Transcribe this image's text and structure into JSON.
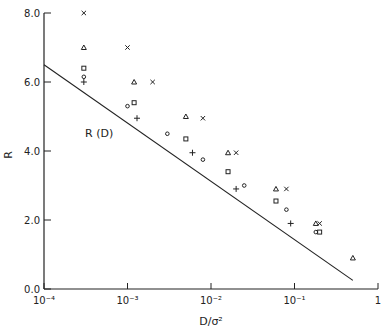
{
  "chart_data": {
    "type": "scatter",
    "title": "",
    "xlabel": "D/σ²",
    "ylabel": "R",
    "xscale": "log",
    "xlim": [
      0.0001,
      1
    ],
    "ylim": [
      0,
      8
    ],
    "x_tick_labels": [
      "10⁻⁴",
      "10⁻³",
      "10⁻²",
      "10⁻¹",
      "1"
    ],
    "y_tick_labels": [
      "0.0",
      "2.0",
      "4.0",
      "6.0",
      "8.0"
    ],
    "grid": false,
    "annotations": [
      {
        "text": "R (D)",
        "x": 0.00031,
        "y": 4.4
      }
    ],
    "curve": {
      "name": "R (D)",
      "x": [
        0.0001,
        0.5
      ],
      "y": [
        6.5,
        0.25
      ]
    },
    "series": [
      {
        "name": "×",
        "marker": "cross",
        "x": [
          0.0003,
          0.001,
          0.002,
          0.008,
          0.02,
          0.08,
          0.2
        ],
        "y": [
          8.0,
          7.0,
          6.0,
          4.95,
          3.95,
          2.9,
          1.9
        ]
      },
      {
        "name": "▲",
        "marker": "triangle",
        "x": [
          0.0003,
          0.0012,
          0.005,
          0.016,
          0.06,
          0.18,
          0.5
        ],
        "y": [
          7.0,
          6.0,
          5.0,
          3.95,
          2.9,
          1.9,
          0.9
        ]
      },
      {
        "name": "□",
        "marker": "square",
        "x": [
          0.0003,
          0.0012,
          0.005,
          0.016,
          0.06,
          0.2
        ],
        "y": [
          6.4,
          5.4,
          4.35,
          3.4,
          2.55,
          1.65
        ]
      },
      {
        "name": "○",
        "marker": "circle",
        "x": [
          0.0003,
          0.001,
          0.003,
          0.008,
          0.025,
          0.08,
          0.18
        ],
        "y": [
          6.15,
          5.3,
          4.5,
          3.75,
          3.0,
          2.3,
          1.65
        ]
      },
      {
        "name": "+",
        "marker": "plus",
        "x": [
          0.0003,
          0.0013,
          0.006,
          0.02,
          0.09
        ],
        "y": [
          6.0,
          4.95,
          3.95,
          2.9,
          1.9
        ]
      }
    ]
  }
}
